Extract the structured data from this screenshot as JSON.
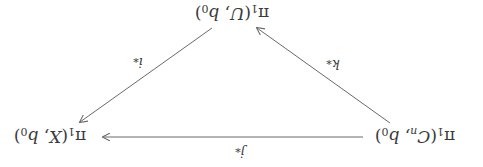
{
  "diagram": {
    "type": "commutative-triangle",
    "orientation_deg": 180,
    "nodes": {
      "top": {
        "id": "piU",
        "label": "π₁(U, b₀)",
        "group": "π",
        "sub": "1",
        "space": "U",
        "base": "b",
        "base_sub": "0"
      },
      "left": {
        "id": "piCn",
        "label": "π₁(Cₙ, b₀)",
        "group": "π",
        "sub": "1",
        "space": "C",
        "space_sub": "n",
        "base": "b",
        "base_sub": "0"
      },
      "right": {
        "id": "piX",
        "label": "π₁(X, b₀)",
        "group": "π",
        "sub": "1",
        "space": "X",
        "base": "b",
        "base_sub": "0"
      }
    },
    "edges": [
      {
        "from": "piCn",
        "to": "piU",
        "label": "k*",
        "sym": "k",
        "sup": "*"
      },
      {
        "from": "piU",
        "to": "piX",
        "label": "i*",
        "sym": "i",
        "sup": "*"
      },
      {
        "from": "piCn",
        "to": "piX",
        "label": "j*",
        "sym": "j",
        "sup": "*"
      }
    ],
    "colors": {
      "stroke": "#6a6a6a",
      "text": "#3a3a3a",
      "background": "#ffffff"
    }
  }
}
